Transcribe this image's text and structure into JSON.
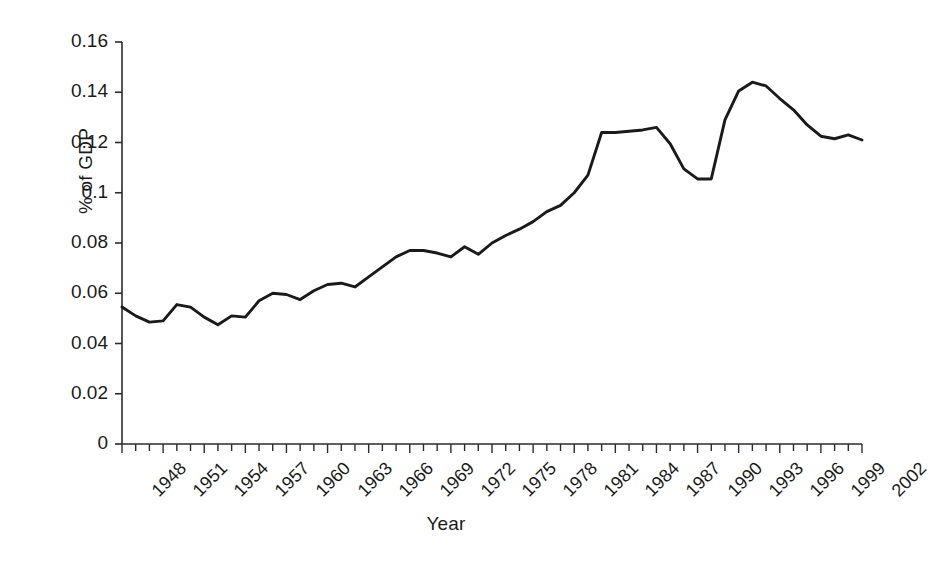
{
  "chart_data": {
    "type": "line",
    "title": "",
    "xlabel": "Year",
    "ylabel": "% of GDP",
    "grid": false,
    "legend": "none",
    "xlim": [
      1948,
      2002
    ],
    "ylim": [
      0,
      0.16
    ],
    "ytick_labels": [
      "0.16",
      "0.14",
      "0.12",
      "0.1",
      "0.08",
      "0.06",
      "0.04",
      "0.02",
      "0"
    ],
    "ytick_values": [
      0.16,
      0.14,
      0.12,
      0.1,
      0.08,
      0.06,
      0.04,
      0.02,
      0
    ],
    "xtick_labels": [
      "1948",
      "1951",
      "1954",
      "1957",
      "1960",
      "1963",
      "1966",
      "1969",
      "1972",
      "1975",
      "1978",
      "1981",
      "1984",
      "1987",
      "1990",
      "1993",
      "1996",
      "1999",
      "2002"
    ],
    "xtick_values": [
      1948,
      1951,
      1954,
      1957,
      1960,
      1963,
      1966,
      1969,
      1972,
      1975,
      1978,
      1981,
      1984,
      1987,
      1990,
      1993,
      1996,
      1999,
      2002
    ],
    "xtick_interval_years": 3,
    "minor_tick_interval_years": 1,
    "series": [
      {
        "name": "% of GDP",
        "color": "#1a1a1a",
        "x": [
          1948,
          1949,
          1950,
          1951,
          1952,
          1953,
          1954,
          1955,
          1956,
          1957,
          1958,
          1959,
          1960,
          1961,
          1962,
          1963,
          1964,
          1965,
          1966,
          1967,
          1968,
          1969,
          1970,
          1971,
          1972,
          1973,
          1974,
          1975,
          1976,
          1977,
          1978,
          1979,
          1980,
          1981,
          1982,
          1983,
          1984,
          1985,
          1986,
          1987,
          1988,
          1989,
          1990,
          1991,
          1992,
          1993,
          1994,
          1995,
          1996,
          1997,
          1998,
          1999,
          2000,
          2001,
          2002
        ],
        "y": [
          0.0545,
          0.051,
          0.0485,
          0.049,
          0.0555,
          0.0545,
          0.0505,
          0.0475,
          0.051,
          0.0505,
          0.057,
          0.06,
          0.0595,
          0.0575,
          0.061,
          0.0635,
          0.064,
          0.0625,
          0.0665,
          0.0705,
          0.0745,
          0.077,
          0.077,
          0.076,
          0.0745,
          0.0785,
          0.0755,
          0.08,
          0.083,
          0.0855,
          0.0885,
          0.0925,
          0.095,
          0.1,
          0.107,
          0.124,
          0.124,
          0.1245,
          0.125,
          0.126,
          0.1195,
          0.1095,
          0.1055,
          0.1055,
          0.129,
          0.1405,
          0.144,
          0.1425,
          0.1375,
          0.133,
          0.127,
          0.1225,
          0.1215,
          0.123,
          0.121
        ]
      }
    ]
  },
  "axes": {
    "ylabel": "% of GDP",
    "xlabel": "Year"
  }
}
